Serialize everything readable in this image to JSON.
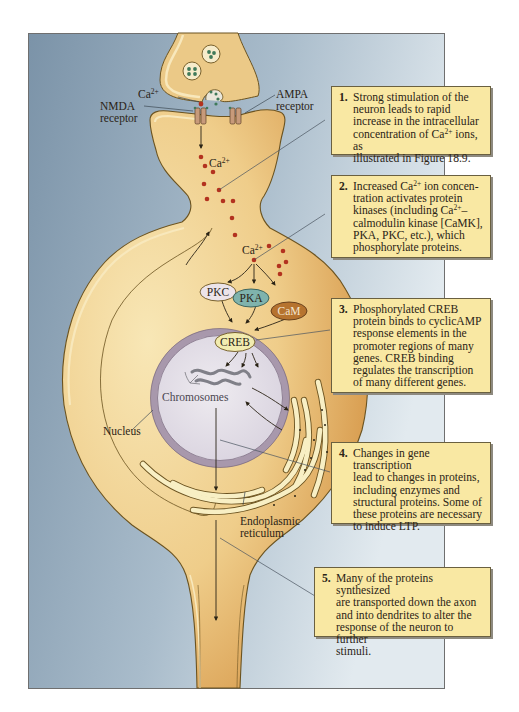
{
  "figure": {
    "colors": {
      "background_left": "#7f97ab",
      "background_right": "#dde7ed",
      "panel_border": "#6f6f6f",
      "cytoplasm_light": "#f5dfa6",
      "cytoplasm_dark": "#d89a4a",
      "membrane": "#7a5a20",
      "nucleus_envelope": "#a898ac",
      "nucleoplasm": "#e4e0e8",
      "calcium_dot": "#b3321f",
      "glutamate_dot": "#3f7a5a",
      "callout_fill": "#f9e8a3",
      "pkc_fill": "#ece4ea",
      "pka_fill": "#7fb3ad",
      "cam_fill": "#b6732f",
      "creb_fill": "#f2ecb0"
    },
    "labels": {
      "ca_presynaptic_base": "Ca",
      "ca_presynaptic_sup": "2+",
      "nmda": "NMDA",
      "nmda_receptor": "receptor",
      "ampa": "AMPA",
      "ampa_receptor": "receptor",
      "ca_spine_base": "Ca",
      "ca_spine_sup": "2+",
      "ca_soma_base": "Ca",
      "ca_soma_sup": "2+",
      "chromosomes": "Chromosomes",
      "nucleus": "Nucleus",
      "er_line1": "Endoplasmic",
      "er_line2": "reticulum"
    },
    "enzymes": {
      "pkc": "PKC",
      "pka": "PKA",
      "cam": "CaM",
      "creb": "CREB"
    },
    "callouts": [
      {
        "number": "1.",
        "parts": [
          "Strong stimulation of the\nneuron leads to rapid\nincrease in the intracellular\nconcentration of Ca",
          "2+",
          " ions, as\nillustrated in Figure 18.9."
        ]
      },
      {
        "number": "2.",
        "parts": [
          "Increased Ca",
          "2+",
          " ion concen-\ntration activates protein\nkinases (including Ca",
          "2+",
          "–\ncalmodulin kinase [CaMK],\nPKA, PKC, etc.), which\nphosphorylate proteins."
        ]
      },
      {
        "number": "3.",
        "text": "Phosphorylated CREB\nprotein binds to cyclicAMP\nresponse elements in the\npromoter regions of many\ngenes. CREB binding\nregulates the transcription\nof many different genes."
      },
      {
        "number": "4.",
        "text": "Changes in gene transcription\nlead to changes in proteins,\nincluding enzymes and\nstructural proteins. Some of\nthese proteins are necessary\nto induce LTP."
      },
      {
        "number": "5.",
        "text": "Many of the proteins synthesized\nare transported down the axon\nand into dendrites to alter the\nresponse of the neuron to further\nstimuli."
      }
    ]
  }
}
